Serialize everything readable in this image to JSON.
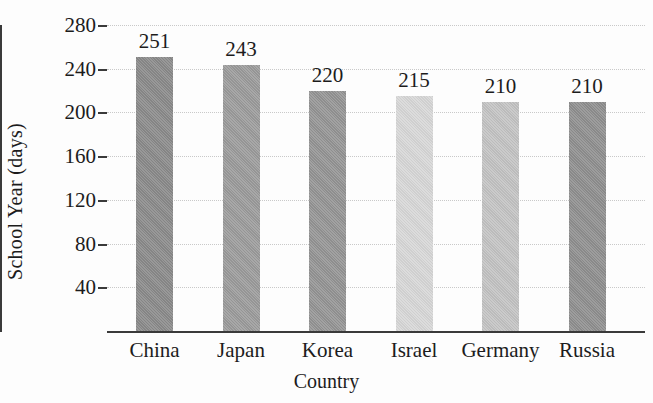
{
  "chart_data": {
    "type": "bar",
    "title": "",
    "xlabel": "Country",
    "ylabel": "School Year (days)",
    "categories": [
      "China",
      "Japan",
      "Korea",
      "Israel",
      "Germany",
      "Russia"
    ],
    "values": [
      251,
      243,
      220,
      215,
      210,
      210
    ],
    "value_labels": [
      "251",
      "243",
      "220",
      "215",
      "210",
      "210"
    ],
    "bar_colors": [
      "#8a8a8a",
      "#9b9b9b",
      "#949494",
      "#d7d7d7",
      "#c3c3c3",
      "#8f8f8f"
    ],
    "ylim": [
      0,
      280
    ],
    "yticks": [
      280,
      240,
      200,
      160,
      120,
      80,
      40
    ],
    "ytick_labels": [
      "280",
      "240",
      "200",
      "160",
      "120",
      "80",
      "40"
    ],
    "grid": true,
    "grid_color": "#c9c9c9",
    "axis_color": "#3a3a3a",
    "legend": "none",
    "background": "#fdfdfd"
  }
}
